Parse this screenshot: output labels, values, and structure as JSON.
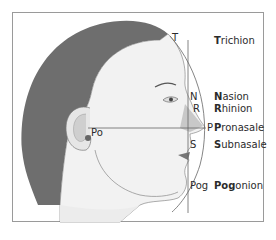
{
  "diagram": {
    "type": "facial profile landmarks",
    "colors": {
      "hair": "#6e6e6e",
      "skin": "#f2f2f2",
      "line": "#555555",
      "nose_shade": "#bdbdbd",
      "border": "#9a9a9a"
    },
    "points": [
      {
        "abbr": "T",
        "name_bold": "T",
        "name_rest": "richion"
      },
      {
        "abbr": "N",
        "name_bold": "N",
        "name_rest": "asion"
      },
      {
        "abbr": "R",
        "name_bold": "R",
        "name_rest": "hinion"
      },
      {
        "abbr": "P",
        "name_bold": "P",
        "name_rest": "ronasale"
      },
      {
        "abbr": "S",
        "name_bold": "S",
        "name_rest": "ubnasale"
      },
      {
        "abbr": "Pog",
        "name_bold": "Pog",
        "name_rest": "onion"
      }
    ],
    "ear_point": {
      "abbr": "Po"
    }
  }
}
